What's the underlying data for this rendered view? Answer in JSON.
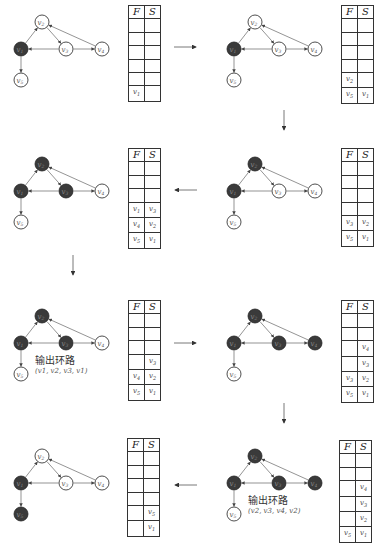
{
  "table_headers": {
    "f": "F",
    "s": "S"
  },
  "vertex_labels": {
    "v1": "v1",
    "v2": "v2",
    "v3": "v3",
    "v4": "v4",
    "v5": "v5"
  },
  "colors": {
    "visited": "#3a3a3a",
    "unvisited": "#ffffff",
    "edge": "#555555",
    "border": "#333333"
  },
  "panels": [
    {
      "id": 1,
      "dark": [
        "v1"
      ],
      "rows": [
        [
          "",
          ""
        ],
        [
          "",
          ""
        ],
        [
          "",
          ""
        ],
        [
          "",
          ""
        ],
        [
          "",
          ""
        ],
        [
          "v1",
          ""
        ]
      ]
    },
    {
      "id": 2,
      "dark": [
        "v1"
      ],
      "rows": [
        [
          "",
          ""
        ],
        [
          "",
          ""
        ],
        [
          "",
          ""
        ],
        [
          "",
          ""
        ],
        [
          "v2",
          ""
        ],
        [
          "v5",
          "v1"
        ]
      ]
    },
    {
      "id": 3,
      "dark": [
        "v1",
        "v2"
      ],
      "rows": [
        [
          "",
          ""
        ],
        [
          "",
          ""
        ],
        [
          "",
          ""
        ],
        [
          "",
          ""
        ],
        [
          "v3",
          "v2"
        ],
        [
          "v5",
          "v1"
        ]
      ]
    },
    {
      "id": 4,
      "dark": [
        "v1",
        "v2",
        "v3"
      ],
      "rows": [
        [
          "",
          ""
        ],
        [
          "",
          ""
        ],
        [
          "",
          ""
        ],
        [
          "v1",
          "v3"
        ],
        [
          "v4",
          "v2"
        ],
        [
          "v5",
          "v1"
        ]
      ]
    },
    {
      "id": 5,
      "dark": [
        "v1",
        "v2",
        "v3"
      ],
      "rows": [
        [
          "",
          ""
        ],
        [
          "",
          ""
        ],
        [
          "",
          ""
        ],
        [
          "",
          "v3"
        ],
        [
          "v4",
          "v2"
        ],
        [
          "v5",
          "v1"
        ]
      ],
      "note": "输出环路",
      "cycle": "(v1, v2, v3, v1)"
    },
    {
      "id": 6,
      "dark": [
        "v1",
        "v2",
        "v3",
        "v4"
      ],
      "rows": [
        [
          "",
          ""
        ],
        [
          "",
          ""
        ],
        [
          "",
          "v4"
        ],
        [
          "",
          "v3"
        ],
        [
          "v3",
          "v2"
        ],
        [
          "v5",
          "v1"
        ]
      ]
    },
    {
      "id": 7,
      "dark": [
        "v1",
        "v2",
        "v3",
        "v4"
      ],
      "rows": [
        [
          "",
          ""
        ],
        [
          "",
          ""
        ],
        [
          "",
          "v4"
        ],
        [
          "",
          "v3"
        ],
        [
          "",
          "v2"
        ],
        [
          "v5",
          "v1"
        ]
      ],
      "note": "输出环路",
      "cycle": "(v2, v3, v4, v2)"
    },
    {
      "id": 8,
      "dark": [
        "v1",
        "v5"
      ],
      "rows": [
        [
          "",
          ""
        ],
        [
          "",
          ""
        ],
        [
          "",
          ""
        ],
        [
          "",
          ""
        ],
        [
          "",
          "v5"
        ],
        [
          "",
          "v1"
        ]
      ]
    }
  ]
}
